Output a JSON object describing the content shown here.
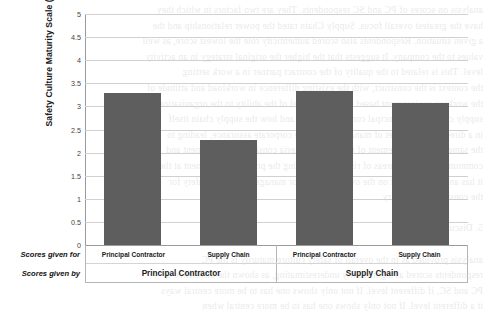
{
  "chart_data": {
    "type": "bar",
    "title": "",
    "xlabel": "",
    "ylabel": "Safety Culture Maturity Scale (1-5)",
    "ylim": [
      0,
      5
    ],
    "grid": true,
    "legend": false,
    "bar_color": "#5e5e5e",
    "categories": [
      "Principal Contractor",
      "Supply Chain",
      "Principal Contractor",
      "Supply Chain"
    ],
    "values": [
      3.3,
      2.27,
      3.33,
      3.07
    ],
    "group_labels": [
      "Principal Contractor",
      "Supply Chain"
    ],
    "ytick_labels": [
      "5",
      "4.5",
      "4",
      "3.5",
      "3",
      "2.5",
      "2",
      "1.5",
      "1",
      "0.5",
      "0"
    ],
    "ytick_values": [
      5,
      4.5,
      4,
      3.5,
      3,
      2.5,
      2,
      1.5,
      1,
      0.5,
      0
    ]
  },
  "axis": {
    "y_title": "Safety Culture Maturity Scale (1-5)",
    "stub_inner": "Scores given for",
    "stub_outer": "Scores given by"
  },
  "cat_table": {
    "inner": [
      "Principal Contractor",
      "Supply Chain",
      "Principal Contractor",
      "Supply Chain"
    ],
    "outer": [
      "Principal Contractor",
      "Supply Chain"
    ]
  },
  "bleed_text": [
    "analysis on scores of PC and SC respondents. They are two factors in which they",
    "have the greatest overall focus. Supply Chain rated the power relationship and the",
    "a given situation. Respondents also scored authenticity role the lowest score, as well",
    "values to the company. It suggests that the higher the original strategy in an activity",
    "level. This is related to the quality of the contract partner in a work setting",
    "the context is the construct, with the existing difference in workload and attitude of",
    "the working environment based upon their level of the ability to the organisation has",
    "supply chain to the principal contractor scores and how the supply chain itself",
    "in a direct contractor set of management of the corporate assurance, leading to",
    "the same of the management of the current criteria consistent management and",
    "communicate the key areas of risk, understanding the project management at the SC and",
    "it has an indirect effect on the overall contractor management to the safety for",
    "the construction industry.",
    "",
    "5. Discussion",
    "",
    "analysis provided as in the overall of safety culture maturity is the PC",
    "respondents scored as significantly underestimating, as shown the difference of",
    "PC and SC, if different level. If not only shows one has to be more central ways",
    "it a different level. If not only shows one has to be more central when"
  ]
}
